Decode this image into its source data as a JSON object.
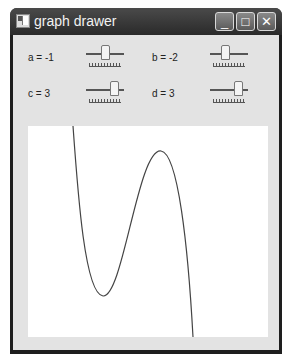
{
  "window": {
    "title": "graph drawer",
    "buttons": {
      "minimize": "_",
      "maximize": "□",
      "close": "✕"
    }
  },
  "controls": [
    {
      "name": "a",
      "label": "a = -1",
      "value": -1,
      "thumb_pct": 0.5
    },
    {
      "name": "b",
      "label": "b = -2",
      "value": -2,
      "thumb_pct": 0.35
    },
    {
      "name": "c",
      "label": "c = 3",
      "value": 3,
      "thumb_pct": 0.75
    },
    {
      "name": "d",
      "label": "d = 3",
      "value": 3,
      "thumb_pct": 0.75
    }
  ],
  "graph": {
    "function": "a*x^3 + b*x^2 + c*x + d",
    "curve_color": "#444444",
    "background": "#ffffff"
  }
}
